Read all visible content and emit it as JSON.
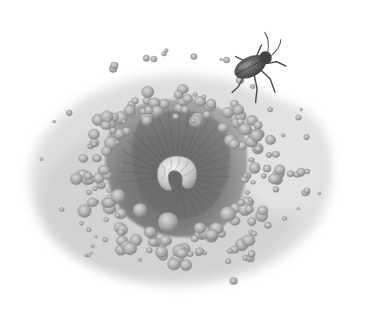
{
  "illustration": {
    "title": "Beetle approaching a sand pit with a curled larva",
    "style": "grayscale pencil illustration",
    "subjects": [
      {
        "name": "beetle",
        "description": "dark beetle walking toward the pit rim"
      },
      {
        "name": "larva",
        "description": "pale curled grub at the bottom of the funnel pit"
      },
      {
        "name": "pit",
        "description": "conical funnel-shaped hole in sandy ground"
      },
      {
        "name": "pebbles",
        "description": "rounded grains and pebbles ringing the pit"
      }
    ]
  },
  "colors": {
    "background": "#ffffff",
    "ground": "#d9d9d9",
    "pit_dark": "#5e5e5e",
    "pit_mid": "#8a8a8a",
    "pebble": "#b4b4b4",
    "pebble_shadow": "#7a7a7a",
    "larva": "#dcdcdc",
    "beetle": "#4a4a4a"
  }
}
